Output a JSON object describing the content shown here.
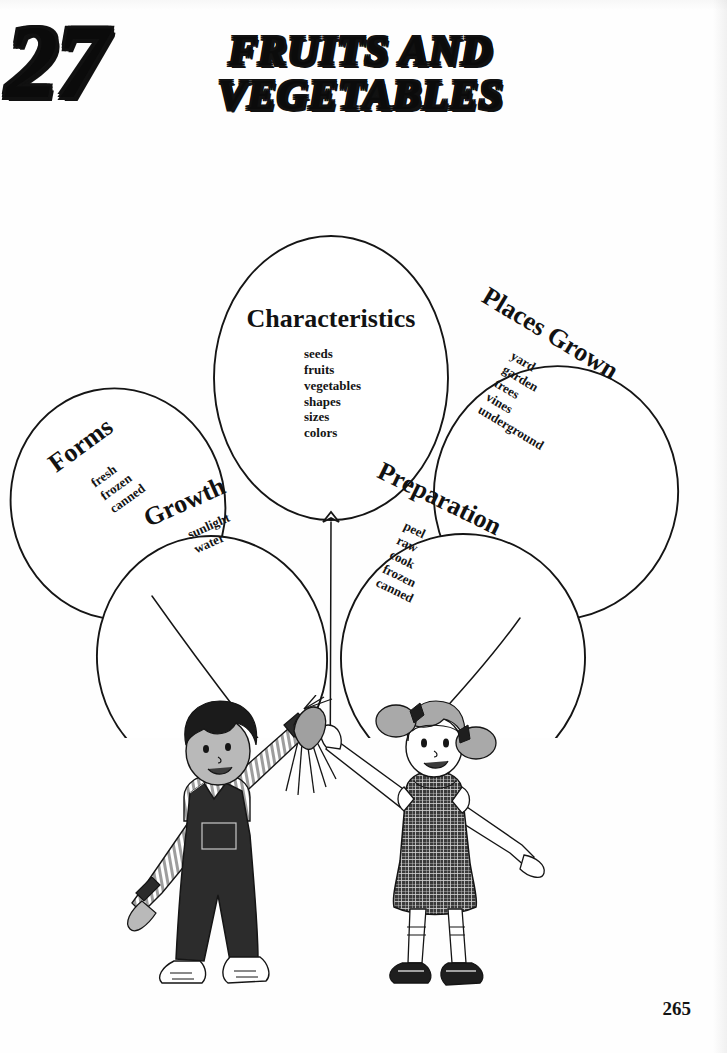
{
  "page": {
    "chapter_number": "27",
    "title_line1": "FRUITS AND",
    "title_line2": "VEGETABLES",
    "page_number": "265",
    "ink_color": "#121212",
    "paper_color": "#fefefe"
  },
  "balloons": [
    {
      "id": "characteristics",
      "label": "Characteristics",
      "items": [
        "seeds",
        "fruits",
        "vegetables",
        "shapes",
        "sizes",
        "colors"
      ],
      "rotation_deg": 0,
      "cx": 331,
      "cy": 260,
      "rx": 117,
      "ry": 142
    },
    {
      "id": "forms",
      "label": "Forms",
      "items": [
        "fresh",
        "frozen",
        "canned"
      ],
      "rotation_deg": -36,
      "cx": 118,
      "cy": 386,
      "rx": 107,
      "ry": 116
    },
    {
      "id": "places-grown",
      "label": "Places Grown",
      "items": [
        "yard",
        "garden",
        "trees",
        "vines",
        "underground"
      ],
      "rotation_deg": 31,
      "cx": 556,
      "cy": 375,
      "rx": 122,
      "ry": 127
    },
    {
      "id": "growth",
      "label": "Growth",
      "items": [
        "sunlight",
        "water"
      ],
      "rotation_deg": -24,
      "cx": 212,
      "cy": 540,
      "rx": 115,
      "ry": 122
    },
    {
      "id": "preparation",
      "label": "Preparation",
      "items": [
        "peel",
        "raw",
        "cook",
        "frozen",
        "canned"
      ],
      "rotation_deg": 26,
      "cx": 463,
      "cy": 540,
      "rx": 122,
      "ry": 124
    }
  ],
  "illustration": {
    "name": "two-children-holding-balloon-strings",
    "boy": {
      "name": "boy",
      "hair": "dark curly",
      "shirt": "gray striped long-sleeve",
      "garment": "dark denim overalls with bib pocket",
      "shoes": "white sneakers"
    },
    "girl": {
      "name": "girl",
      "hair": "gray pigtails with dark bows",
      "garment": "dark checkered jumper dress",
      "socks": "white ruffled socks",
      "shoes": "dark mary-janes"
    },
    "strings": "five balloon strings converging into joined hands"
  },
  "colors": {
    "ink": "#121212",
    "skin_shade": "#9b9b9b",
    "cloth_dark": "#2b2b2b",
    "cloth_mid": "#6e6e6e",
    "cloth_light": "#c9c9c9"
  }
}
